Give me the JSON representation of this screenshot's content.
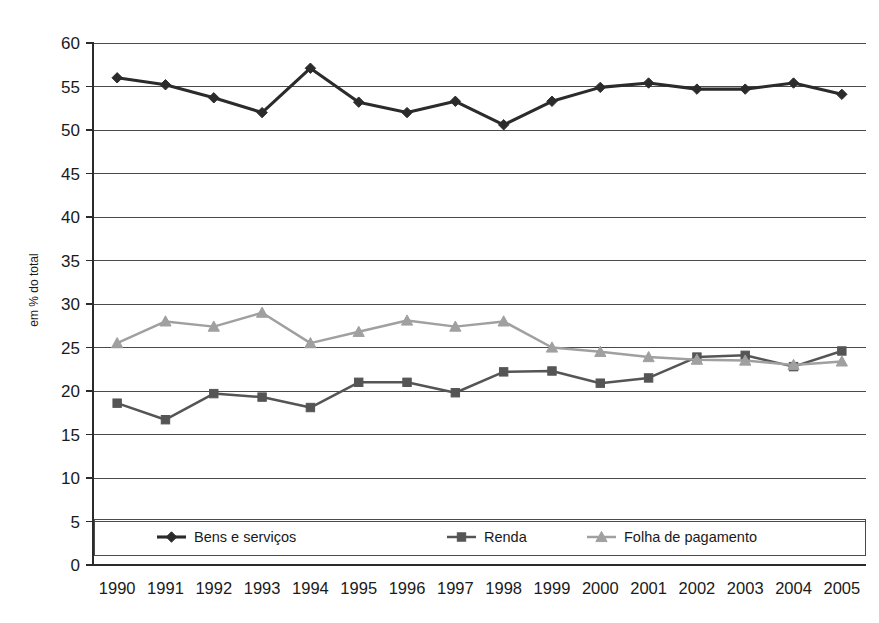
{
  "chart_data": {
    "type": "line",
    "title": "",
    "xlabel": "",
    "ylabel": "em % do total",
    "ylim": [
      0,
      60
    ],
    "ytick_step": 5,
    "grid": true,
    "legend_position": "bottom",
    "categories": [
      "1990",
      "1991",
      "1992",
      "1993",
      "1994",
      "1995",
      "1996",
      "1997",
      "1998",
      "1999",
      "2000",
      "2001",
      "2002",
      "2003",
      "2004",
      "2005"
    ],
    "yticks": [
      "0",
      "5",
      "10",
      "15",
      "20",
      "25",
      "30",
      "35",
      "40",
      "45",
      "50",
      "55",
      "60"
    ],
    "series": [
      {
        "name": "Bens e serviços",
        "marker": "diamond",
        "color": "#2b2b2b",
        "values": [
          56.0,
          55.2,
          53.7,
          52.0,
          57.1,
          53.2,
          52.0,
          53.3,
          50.6,
          53.3,
          54.9,
          55.4,
          54.7,
          54.7,
          55.4,
          54.1
        ]
      },
      {
        "name": "Renda",
        "marker": "square",
        "color": "#555555",
        "values": [
          18.6,
          16.7,
          19.7,
          19.3,
          18.1,
          21.0,
          21.0,
          19.8,
          22.2,
          22.3,
          20.9,
          21.5,
          23.9,
          24.1,
          22.8,
          24.6
        ]
      },
      {
        "name": "Folha de pagamento",
        "marker": "triangle",
        "color": "#a0a0a0",
        "values": [
          25.5,
          28.0,
          27.4,
          29.0,
          25.5,
          26.8,
          28.1,
          27.4,
          28.0,
          25.0,
          24.5,
          23.9,
          23.6,
          23.5,
          23.0,
          23.4
        ]
      }
    ]
  }
}
